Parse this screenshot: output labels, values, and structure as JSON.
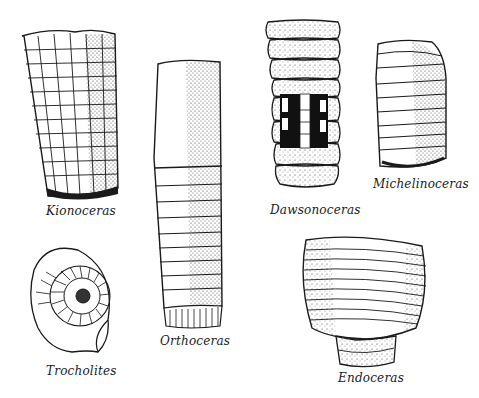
{
  "plate": {
    "ink_color": "#1a1a1a",
    "background_color": "#ffffff",
    "specimens": [
      {
        "id": "kionoceras",
        "label": "Kionoceras",
        "shape": "ribbed-grid tapering shell"
      },
      {
        "id": "orthoceras",
        "label": "Orthoceras",
        "shape": "long straight shell with septa"
      },
      {
        "id": "dawsonoceras",
        "label": "Dawsonoceras",
        "shape": "annulated shell with cut-away siphuncle"
      },
      {
        "id": "michelinoceras",
        "label": "Michelinoceras",
        "shape": "short straight segmented shell"
      },
      {
        "id": "trocholites",
        "label": "Trocholites",
        "shape": "coiled shell"
      },
      {
        "id": "endoceras",
        "label": "Endoceras",
        "shape": "wide annulated shell fragment"
      }
    ]
  }
}
